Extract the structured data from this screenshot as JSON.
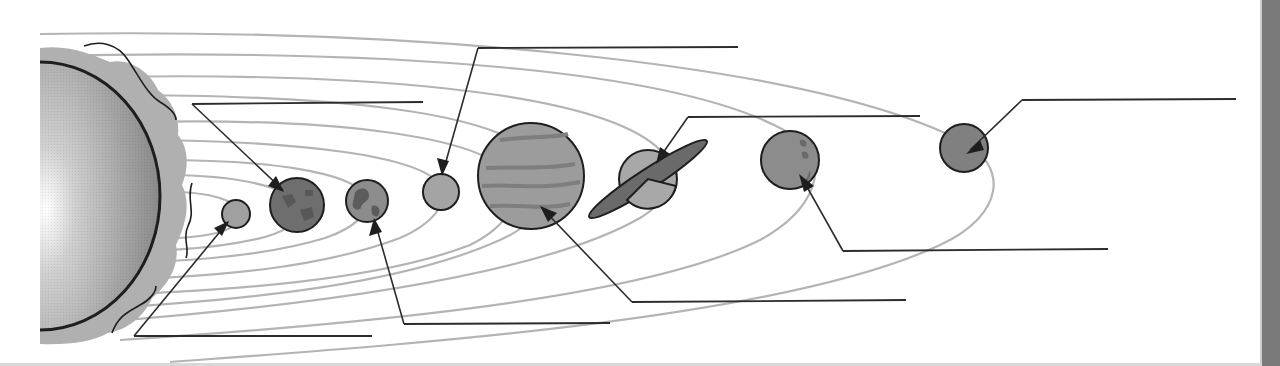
{
  "diagram": {
    "title": "",
    "type": "solar-system-labeling-worksheet",
    "colors": {
      "background": "#ffffff",
      "orbit": "#b4b4b4",
      "leader": "#2c2c2c",
      "sun_light": "#f4f4f4",
      "sun_dark": "#8a8a8a",
      "corona": "#b0b0b0",
      "planet_fill": "#8f8f8f",
      "planet_dark": "#5a5a5a",
      "edge_bar": "#7a7a7a"
    },
    "sun": {
      "name": "sun",
      "label": ""
    },
    "planets": [
      {
        "order": 1,
        "name": "mercury",
        "label": ""
      },
      {
        "order": 2,
        "name": "venus",
        "label": ""
      },
      {
        "order": 3,
        "name": "earth",
        "label": ""
      },
      {
        "order": 4,
        "name": "mars",
        "label": ""
      },
      {
        "order": 5,
        "name": "jupiter",
        "label": ""
      },
      {
        "order": 6,
        "name": "saturn",
        "label": ""
      },
      {
        "order": 7,
        "name": "uranus",
        "label": ""
      },
      {
        "order": 8,
        "name": "neptune",
        "label": ""
      },
      {
        "order": 9,
        "name": "pluto",
        "label": ""
      }
    ],
    "label_blanks": 9
  }
}
